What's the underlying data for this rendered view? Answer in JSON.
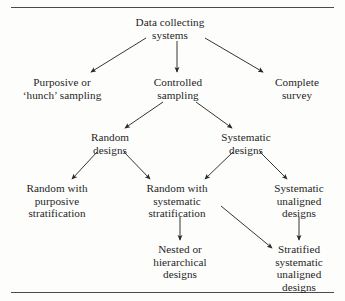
{
  "figure": {
    "kind": "flowchart",
    "title_text": "",
    "rules": {
      "top": true,
      "bottom": true
    }
  },
  "nodes": {
    "root": "Data collecting\nsystems",
    "purposive": "Purposive or\n‘hunch’ sampling",
    "controlled": "Controlled\nsampling",
    "complete": "Complete\nsurvey",
    "random_designs": "Random\ndesigns",
    "systematic_designs": "Systematic\ndesigns",
    "random_purposive": "Random with\npurposive\nstratification",
    "random_systematic": "Random with\nsystematic\nstratification",
    "systematic_unaligned": "Systematic\nunaligned\ndesigns",
    "nested": "Nested or\nhierarchical\ndesigns",
    "stratified": "Stratified\nsystematic\nunaligned\ndesigns"
  },
  "edges": [
    {
      "from": "root",
      "to": "purposive",
      "style": "diagonal-left"
    },
    {
      "from": "root",
      "to": "controlled",
      "style": "vertical"
    },
    {
      "from": "root",
      "to": "complete",
      "style": "diagonal-right"
    },
    {
      "from": "controlled",
      "to": "random_designs",
      "style": "diagonal-left"
    },
    {
      "from": "controlled",
      "to": "systematic_designs",
      "style": "diagonal-right"
    },
    {
      "from": "random_designs",
      "to": "random_purposive",
      "style": "diagonal-left"
    },
    {
      "from": "random_designs",
      "to": "random_systematic",
      "style": "diagonal-right"
    },
    {
      "from": "systematic_designs",
      "to": "random_systematic",
      "style": "diagonal-left"
    },
    {
      "from": "systematic_designs",
      "to": "systematic_unaligned",
      "style": "diagonal-right"
    },
    {
      "from": "random_systematic",
      "to": "nested",
      "style": "vertical"
    },
    {
      "from": "random_systematic",
      "to": "stratified",
      "style": "diagonal-long"
    },
    {
      "from": "systematic_unaligned",
      "to": "stratified",
      "style": "vertical"
    }
  ],
  "style": {
    "ink": "#1f1f1f",
    "rule_color": "#4a4a4a",
    "background": "#fdfdfc"
  }
}
